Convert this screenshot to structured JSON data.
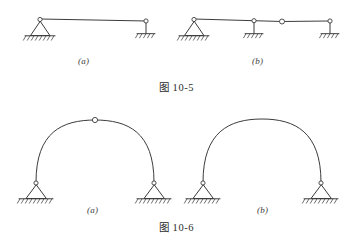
{
  "page": {
    "background_color": "#ffffff",
    "line_color": "#3c3c3c",
    "figures": [
      "图 10-5",
      "图 10-6"
    ]
  },
  "figure_10_5": {
    "caption": "图 10-5",
    "subfigures": [
      {
        "label": "(a)",
        "description": "simply supported beam with pin support at left and link support at right",
        "supports": [
          "pin-triangle-support",
          "link-roller-support"
        ],
        "hinges": 0
      },
      {
        "label": "(b)",
        "description": "multi-span beam with pin support, two link supports and one internal hinge",
        "supports": [
          "pin-triangle-support",
          "link-roller-support",
          "link-roller-support"
        ],
        "hinges": 1
      }
    ]
  },
  "figure_10_6": {
    "caption": "图 10-6",
    "subfigures": [
      {
        "label": "(a)",
        "description": "three-hinged arch with crown hinge and two pin supports",
        "supports": [
          "pin-triangle-support",
          "pin-triangle-support"
        ],
        "hinges": 1
      },
      {
        "label": "(b)",
        "description": "two-hinged arch with two pin supports and no crown hinge",
        "supports": [
          "pin-triangle-support",
          "pin-triangle-support"
        ],
        "hinges": 0
      }
    ]
  }
}
